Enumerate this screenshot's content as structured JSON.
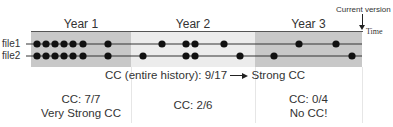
{
  "diagram": {
    "years": [
      {
        "label": "Year 1",
        "x0": 31,
        "x1": 131,
        "color": "#c8c8c8"
      },
      {
        "label": "Year 2",
        "x0": 131,
        "x1": 255,
        "color": "#ececec"
      },
      {
        "label": "Year 3",
        "x0": 255,
        "x1": 362,
        "color": "#c8c8c8"
      }
    ],
    "current_version_label": "Current version",
    "time_label": "Time",
    "files": [
      {
        "label": "file1",
        "y": 44,
        "commits_x": [
          37,
          46,
          55,
          64,
          73,
          83,
          108,
          162,
          186,
          195,
          224,
          299,
          336
        ]
      },
      {
        "label": "file2",
        "y": 56,
        "commits_x": [
          37,
          46,
          55,
          64,
          73,
          83,
          108,
          143,
          186,
          195,
          240,
          274,
          352
        ]
      }
    ],
    "entire_history": {
      "prefix": "CC (entire history): 9/17",
      "result": "Strong CC"
    },
    "per_year": [
      {
        "line1": "CC: 7/7",
        "line2": "Very Strong CC"
      },
      {
        "line1": "CC: 2/6",
        "line2": ""
      },
      {
        "line1": "CC: 0/4",
        "line2": "No CC!"
      }
    ]
  }
}
